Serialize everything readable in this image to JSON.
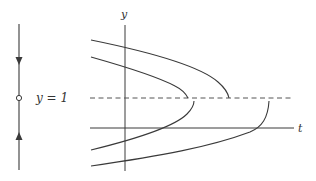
{
  "diagram": {
    "phase_line": {
      "equilibrium_label": "y = 1",
      "equilibrium_value": 1,
      "stability": "semistable",
      "arrows": [
        "down-above",
        "up-below"
      ]
    },
    "axes": {
      "y_label": "y",
      "t_label": "t"
    },
    "equilibrium_line": {
      "style": "dashed",
      "value": 1
    },
    "solution_curves": [
      {
        "id": "upper-outer",
        "region": "above y=1",
        "behavior": "decreases to y=1 in finite time"
      },
      {
        "id": "upper-inner",
        "region": "above y=1",
        "behavior": "decreases to y=1 in finite time"
      },
      {
        "id": "lower-inner",
        "region": "below y=1",
        "behavior": "increases to y=1 in finite time"
      },
      {
        "id": "lower-outer",
        "region": "below y=1",
        "behavior": "increases to y=1 in finite time"
      }
    ],
    "colors": {
      "stroke": "#3a3a3a",
      "dashed": "#555555",
      "background": "#ffffff"
    }
  }
}
